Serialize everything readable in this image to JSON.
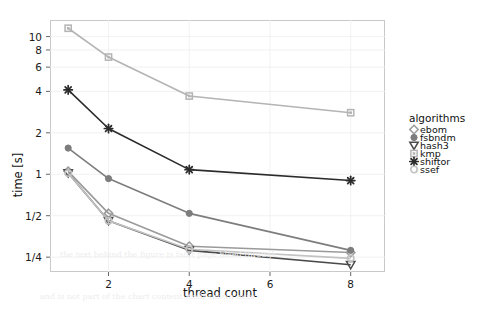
{
  "chart_data": {
    "type": "line",
    "title": "",
    "xlabel": "thread count",
    "ylabel": "time [s]",
    "legend_title": "algorithms",
    "legend_position": "right",
    "grid": true,
    "yscale": "log",
    "xlim": [
      0.55,
      8.85
    ],
    "ylim": [
      0.195,
      13.2
    ],
    "x": [
      1,
      2,
      4,
      8
    ],
    "xticks": [
      2,
      4,
      6,
      8
    ],
    "xticklabels": [
      "2",
      "4",
      "6",
      "8"
    ],
    "yticks": [
      0.25,
      0.5,
      1,
      2,
      4,
      6,
      8,
      10
    ],
    "yticklabels": [
      "1/4",
      "1/2",
      "1",
      "2",
      "4",
      "6",
      "8",
      "10"
    ],
    "series": [
      {
        "name": "ebom",
        "marker": "circle",
        "color": "#9a9a9a",
        "values": [
          1.05,
          0.52,
          0.3,
          0.27
        ]
      },
      {
        "name": "fsbndm",
        "marker": "filled-circle",
        "color": "#7d7d7d",
        "values": [
          1.55,
          0.93,
          0.52,
          0.28
        ]
      },
      {
        "name": "hash3",
        "marker": "triangle-down",
        "color": "#4a4a4a",
        "values": [
          1.02,
          0.46,
          0.28,
          0.22
        ]
      },
      {
        "name": "kmp",
        "marker": "square",
        "color": "#b4b4b4",
        "values": [
          11.5,
          7.1,
          3.7,
          2.8
        ]
      },
      {
        "name": "shiftor",
        "marker": "asterisk",
        "color": "#2b2b2b",
        "values": [
          4.1,
          2.15,
          1.08,
          0.9
        ]
      },
      {
        "name": "ssef",
        "marker": "circle-light",
        "color": "#c2c2c2",
        "values": [
          1.02,
          0.46,
          0.285,
          0.245
        ]
      }
    ]
  },
  "legend": {
    "title": "algorithms",
    "items": [
      {
        "label": "ebom"
      },
      {
        "label": "fsbndm"
      },
      {
        "label": "hash3"
      },
      {
        "label": "kmp"
      },
      {
        "label": "shiftor"
      },
      {
        "label": "ssef"
      }
    ]
  },
  "axes": {
    "x_title": "thread count",
    "y_title": "time [s]",
    "xtick_labels": [
      "2",
      "4",
      "6",
      "8"
    ],
    "ytick_labels": [
      "10",
      "8",
      "6",
      "4",
      "2",
      "1",
      "1/2",
      "1/4"
    ]
  },
  "background_text": {
    "line1": "the text behind the figure is faint page bleed-through",
    "line2": "and is not part of the chart content itself shown here"
  }
}
